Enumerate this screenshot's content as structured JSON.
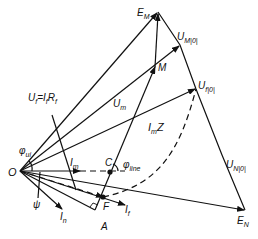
{
  "diagram": {
    "colors": {
      "line": "#111111",
      "background": "#ffffff"
    },
    "nodes": {
      "O": {
        "label": "O",
        "x": 20,
        "y": 171
      },
      "EM": {
        "label": "E",
        "sub": "M",
        "x": 158,
        "y": 12
      },
      "M": {
        "label": "M",
        "x": 155,
        "y": 66
      },
      "UM0": {
        "label": "U",
        "sub": "M|0|",
        "x": 180,
        "y": 45
      },
      "Uf0": {
        "label": "U",
        "sub": "f|0|",
        "x": 196,
        "y": 89
      },
      "EN": {
        "label": "E",
        "sub": "N",
        "x": 245,
        "y": 210
      },
      "UN0": {
        "label": "U",
        "sub": "N|0|",
        "x": 230,
        "y": 168
      },
      "C": {
        "label": "C",
        "x": 110,
        "y": 172
      },
      "F": {
        "label": "F",
        "x": 103,
        "y": 197
      },
      "A": {
        "label": "A",
        "x": 95,
        "y": 214
      }
    },
    "labels": {
      "Uf_eq_IfRf": "U̇f = İf Rf",
      "Uf_main": "U",
      "Uf_sub": "f",
      "If_main": "I",
      "If_sub": "f",
      "Rf_main": "R",
      "Rf_sub": "f",
      "Um_main": "U",
      "Um_sub": "m",
      "ImZ_main": "I",
      "ImZ_sub": "m",
      "ImZ_tail": "Z",
      "Im_main": "I",
      "Im_sub": "m",
      "In_main": "I",
      "In_sub": "n",
      "If2_main": "I",
      "If2_sub": "f",
      "phi_ui_main": "φ",
      "phi_ui_sub": "ui",
      "phi_line_main": "φ",
      "phi_line_sub": "line",
      "psi": "ψ",
      "O": "O",
      "C": "C",
      "F": "F",
      "A": "A",
      "M": "M",
      "EM_main": "E",
      "EM_sub": "M",
      "EN_main": "E",
      "EN_sub": "N",
      "UM0_main": "U",
      "UM0_sub": "M|0|",
      "Uf0_main": "U",
      "Uf0_sub": "f|0|",
      "UN0_main": "U",
      "UN0_sub": "N|0|",
      "dot": "˙"
    }
  }
}
